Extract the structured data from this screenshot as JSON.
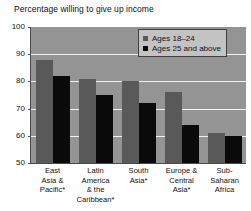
{
  "chart_data": {
    "type": "bar",
    "title": "Percentage willing to give up income",
    "xlabel": "",
    "ylabel": "",
    "ylim": [
      50,
      100
    ],
    "yticks": [
      100,
      90,
      80,
      70,
      60,
      50
    ],
    "grid": true,
    "legend_position": "top-right",
    "categories": [
      "East Asia & Pacific*",
      "Latin America & the Caribbean*",
      "South Asia*",
      "Europe & Central Asia*",
      "Sub-Saharan Africa"
    ],
    "category_lines": [
      [
        "East",
        "Asia &",
        "Pacific*"
      ],
      [
        "Latin",
        "America",
        "& the",
        "Caribbean*"
      ],
      [
        "South",
        "Asia*"
      ],
      [
        "Europe &",
        "Central",
        "Asia*"
      ],
      [
        "Sub-",
        "Saharan",
        "Africa"
      ]
    ],
    "series": [
      {
        "name": "Ages 18–24",
        "color": "#595959",
        "values": [
          88,
          81,
          80,
          76,
          61
        ]
      },
      {
        "name": "Ages 25 and above",
        "color": "#0a0a0a",
        "values": [
          82,
          75,
          72,
          64,
          60
        ]
      }
    ]
  },
  "colors": {
    "plot_background": "#949494",
    "gridline": "#f2f2f2",
    "axis": "#4a4a4a",
    "legend_background": "#c3c3c3",
    "legend_border": "#3f3f3f",
    "page_background": "#ffffff",
    "text": "#111111"
  }
}
